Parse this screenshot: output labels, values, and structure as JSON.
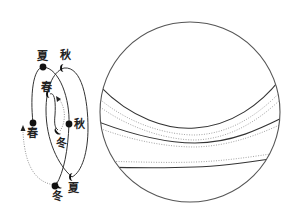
{
  "figure": {
    "left_diagram": {
      "title": "seasonal orbit loops",
      "labels": [
        {
          "id": "summer_top",
          "text": "夏",
          "x": 40,
          "y": 60
        },
        {
          "id": "autumn_top",
          "text": "秋",
          "x": 62,
          "y": 59
        },
        {
          "id": "spring_mid",
          "text": "春",
          "x": 44,
          "y": 91
        },
        {
          "id": "spring_left",
          "text": "春",
          "x": 30,
          "y": 137
        },
        {
          "id": "autumn_right",
          "text": "秋",
          "x": 75,
          "y": 128
        },
        {
          "id": "winter_mid",
          "text": "冬",
          "x": 57,
          "y": 147
        },
        {
          "id": "winter_bottom",
          "text": "冬",
          "x": 53,
          "y": 199
        },
        {
          "id": "summer_bottom",
          "text": "夏",
          "x": 69,
          "y": 192
        }
      ],
      "markers": {
        "full_dots": [
          "summer_top",
          "spring_left",
          "autumn_right",
          "winter_bottom"
        ],
        "half_moons": [
          "autumn_top",
          "spring_mid",
          "winter_mid",
          "summer_bottom"
        ],
        "arrowheads": [
          "dotted-arrow-up-left",
          "dotted-arrow-up-mid"
        ]
      }
    },
    "right_diagram": {
      "title": "sphere with latitudinal bands",
      "circle": {
        "cx": 190,
        "cy": 112,
        "r": 90
      },
      "bands": [
        {
          "style": "solid",
          "desc": "upper band boundary"
        },
        {
          "style": "dotted",
          "desc": "upper inner line 1"
        },
        {
          "style": "dotted",
          "desc": "upper inner line 2"
        },
        {
          "style": "solid",
          "desc": "middle band boundary"
        },
        {
          "style": "dotted",
          "desc": "middle inner line"
        },
        {
          "style": "dotted",
          "desc": "lower inner line"
        },
        {
          "style": "solid",
          "desc": "lower band boundary"
        }
      ]
    },
    "colors": {
      "ink": "#222222",
      "line": "#333333",
      "dotted": "#888888",
      "background": "#ffffff"
    }
  }
}
